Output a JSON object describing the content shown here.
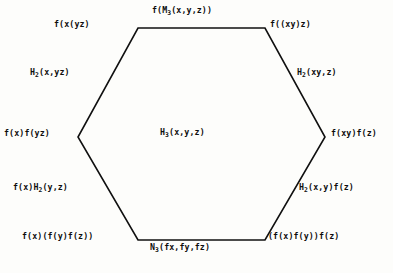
{
  "diagram": {
    "type": "hexagonal-commutative-diagram",
    "shape": "hexagon",
    "stroke_color": "#101010",
    "background_color": "#fdfdfb",
    "vertices": [
      {
        "id": "top-left",
        "label_main": "f(x(yz)",
        "label_sub": "",
        "label_tail": "",
        "full": "f(x(yz)"
      },
      {
        "id": "top-right",
        "label_main": "f((xy)z)",
        "label_sub": "",
        "label_tail": "",
        "full": "f((xy)z)"
      },
      {
        "id": "left",
        "label_main": "f(x)f(yz)",
        "label_sub": "",
        "label_tail": "",
        "full": "f(x)f(yz)"
      },
      {
        "id": "right",
        "label_main": "f(xy)f(z)",
        "label_sub": "",
        "label_tail": "",
        "full": "f(xy)f(z)"
      },
      {
        "id": "bottom-left",
        "label_main": "f(x)(f(y)f(z))",
        "label_sub": "",
        "label_tail": "",
        "full": "f(x)(f(y)f(z))"
      },
      {
        "id": "bottom-right",
        "label_main": "(f(x)f(y))f(z)",
        "label_sub": "",
        "label_tail": "",
        "full": "(f(x)f(y))f(z)"
      }
    ],
    "edges": [
      {
        "id": "top",
        "label_main": "f(M",
        "label_sub": "3",
        "label_tail": "(x,y,z))",
        "full": "f(M3(x,y,z))"
      },
      {
        "id": "upper-left",
        "label_main": "H",
        "label_sub": "2",
        "label_tail": "(x,yz)",
        "full": "H2(x,yz)"
      },
      {
        "id": "upper-right",
        "label_main": "H",
        "label_sub": "2",
        "label_tail": "(xy,z)",
        "full": "H2(xy,z)"
      },
      {
        "id": "lower-left",
        "label_main": "f(x)H",
        "label_sub": "2",
        "label_tail": "(y,z)",
        "full": "f(x)H2(y,z)"
      },
      {
        "id": "lower-right",
        "label_main": "H",
        "label_sub": "2",
        "label_tail": "(x,y)f(z)",
        "full": "H2(x,y)f(z)"
      },
      {
        "id": "bottom",
        "label_main": "N",
        "label_sub": "3",
        "label_tail": "(fx,fy,fz)",
        "full": "N3(fx,fy,fz)"
      }
    ],
    "center": {
      "id": "center",
      "label_main": "H",
      "label_sub": "3",
      "label_tail": "(x,y,z)",
      "full": "H3(x,y,z)"
    },
    "geometry": {
      "points": "138,28 265,28 325,137 265,240 138,240 78,137",
      "stroke_width": 1.6
    }
  }
}
